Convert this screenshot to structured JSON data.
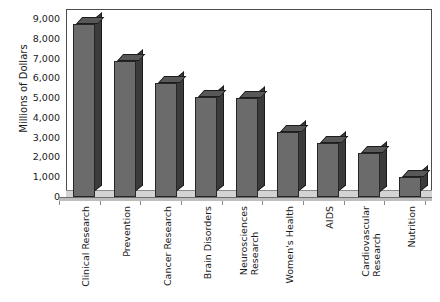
{
  "chart_data": {
    "type": "bar",
    "title": "National Institutes of Health Research Funding",
    "subtitle": "",
    "xlabel": "",
    "ylabel": "Millions of Dollars",
    "ylim": [
      0,
      9000
    ],
    "ytick_labels": [
      "9,000",
      "8,000",
      "7,000",
      "6,000",
      "5,000",
      "4,000",
      "3,000",
      "2,000",
      "1,000",
      "0"
    ],
    "ytick_values": [
      9000,
      8000,
      7000,
      6000,
      5000,
      4000,
      3000,
      2000,
      1000,
      0
    ],
    "grid": false,
    "legend": "none",
    "style": "3d-column",
    "bar_color": "#6b6b6b",
    "bar_side_color": "#3b3b3b",
    "bar_top_color": "#585858",
    "categories": [
      "Clinical Research",
      "Prevention",
      "Cancer Research",
      "Brain Disorders",
      "Neurosciences Research",
      "Women's Health",
      "AIDS",
      "Cardiovascular Research",
      "Nutrition"
    ],
    "category_lines": [
      [
        "Clinical Research"
      ],
      [
        "Prevention"
      ],
      [
        "Cancer Research"
      ],
      [
        "Brain Disorders"
      ],
      [
        "Neurosciences",
        "Research"
      ],
      [
        "Women's Health"
      ],
      [
        "AIDS"
      ],
      [
        "Cardiovascular",
        "Research"
      ],
      [
        "Nutrition"
      ]
    ],
    "values": [
      8750,
      6900,
      5750,
      5050,
      5000,
      3300,
      2750,
      2250,
      1000
    ]
  }
}
